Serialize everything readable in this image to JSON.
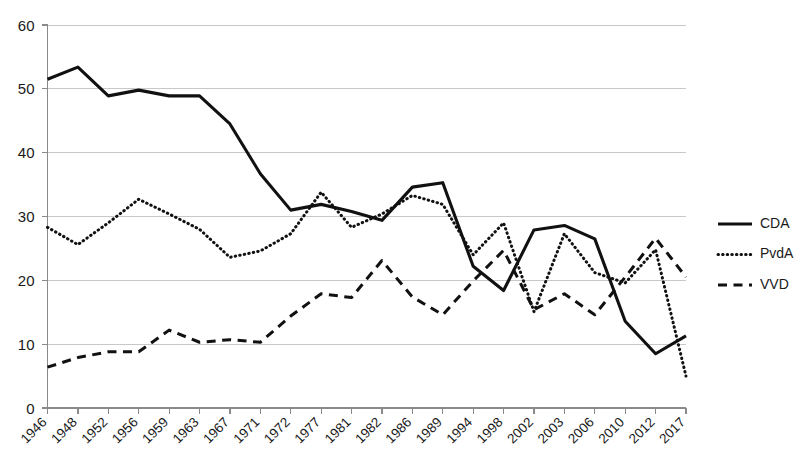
{
  "chart_data": {
    "type": "line",
    "title": "",
    "subtitle": "",
    "xlabel": "",
    "ylabel": "",
    "ylim": [
      0,
      60
    ],
    "yticks": [
      0,
      10,
      20,
      30,
      40,
      50,
      60
    ],
    "grid": true,
    "legend_position": "right",
    "categories": [
      "1946",
      "1948",
      "1952",
      "1956",
      "1959",
      "1963",
      "1967",
      "1971",
      "1972",
      "1977",
      "1981",
      "1982",
      "1986",
      "1989",
      "1994",
      "1998",
      "2002",
      "2003",
      "2006",
      "2010",
      "2012",
      "2017"
    ],
    "series": [
      {
        "name": "CDA",
        "style": "solid",
        "values": [
          51.5,
          53.4,
          48.9,
          49.8,
          48.9,
          48.9,
          44.5,
          36.7,
          31.0,
          31.9,
          30.8,
          29.4,
          34.6,
          35.3,
          22.2,
          18.4,
          27.9,
          28.6,
          26.5,
          13.6,
          8.5,
          11.3
        ]
      },
      {
        "name": "PvdA",
        "style": "dotted",
        "values": [
          28.3,
          25.6,
          29.0,
          32.7,
          30.4,
          28.0,
          23.6,
          24.6,
          27.3,
          33.8,
          28.3,
          30.4,
          33.3,
          31.9,
          24.0,
          29.0,
          15.1,
          27.3,
          21.2,
          19.6,
          24.8,
          5.0
        ]
      },
      {
        "name": "VVD",
        "style": "dashed",
        "values": [
          6.4,
          7.9,
          8.8,
          8.8,
          12.2,
          10.3,
          10.7,
          10.3,
          14.4,
          17.9,
          17.3,
          23.1,
          17.4,
          14.6,
          19.9,
          24.7,
          15.4,
          17.9,
          14.6,
          20.5,
          26.6,
          20.5
        ]
      }
    ]
  },
  "axis": {
    "y_labels": [
      "60",
      "50",
      "40",
      "30",
      "20",
      "10",
      "0"
    ],
    "x_labels": [
      "1946",
      "1948",
      "1952",
      "1956",
      "1959",
      "1963",
      "1967",
      "1971",
      "1972",
      "1977",
      "1981",
      "1982",
      "1986",
      "1989",
      "1994",
      "1998",
      "2002",
      "2003",
      "2006",
      "2010",
      "2012",
      "2017"
    ]
  },
  "legend": {
    "items": [
      {
        "label": "CDA"
      },
      {
        "label": "PvdA"
      },
      {
        "label": "VVD"
      }
    ]
  },
  "colors": {
    "line": "#111111",
    "grid": "#c8c8c8",
    "axis": "#8a8a8a",
    "text": "#1a1a1a",
    "background": "#ffffff"
  }
}
